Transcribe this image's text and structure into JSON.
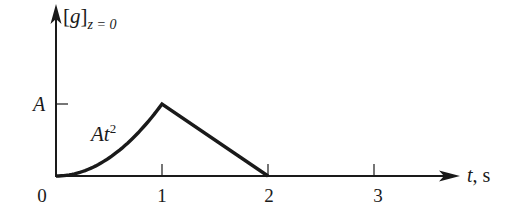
{
  "chart_data": {
    "type": "line",
    "title": "",
    "ylabel": "[g]_{z = 0}",
    "ylabel_parts": {
      "bracket_open": "[",
      "var": "g",
      "bracket_close": "]",
      "subscript": "z = 0"
    },
    "xlabel": "t, s",
    "xlabel_parts": {
      "var": "t",
      "unit": ", s"
    },
    "x_ticks": [
      0,
      1,
      2,
      3
    ],
    "x_tick_labels": [
      "0",
      "1",
      "2",
      "3"
    ],
    "y_ticks": [
      "A"
    ],
    "y_tick_labels": [
      "A"
    ],
    "xlim": [
      0,
      3.6
    ],
    "ylim": [
      0,
      1.45
    ],
    "grid": false,
    "legend": null,
    "series": [
      {
        "name": "[g]_{z=0}",
        "segments": [
          {
            "range": [
              0,
              1
            ],
            "expression": "A t^2",
            "x": [
              0,
              0.25,
              0.5,
              0.75,
              1.0
            ],
            "y": [
              0,
              0.0625,
              0.25,
              0.5625,
              1.0
            ]
          },
          {
            "range": [
              1,
              2
            ],
            "expression": "A (2 - t)",
            "x": [
              1,
              2
            ],
            "y": [
              1.0,
              0.0
            ]
          }
        ],
        "x": [
          0,
          0.25,
          0.5,
          0.75,
          1.0,
          2.0
        ],
        "y": [
          0,
          0.0625,
          0.25,
          0.5625,
          1.0,
          0.0
        ],
        "y_units": "A"
      }
    ],
    "annotations": [
      {
        "text": "At^2",
        "base": "At",
        "superscript": "2",
        "near": {
          "x": 0.6,
          "y": 0.55
        }
      }
    ]
  },
  "labels": {
    "y_axis": {
      "open": "[",
      "var": "g",
      "close": "]",
      "sub": "z = 0"
    },
    "x_axis": {
      "var": "t",
      "unit": ", s"
    },
    "curve_annotation": {
      "base": "At",
      "sup": "2"
    },
    "y_tick_A": "A",
    "x_ticks": [
      "0",
      "1",
      "2",
      "3"
    ]
  },
  "colors": {
    "ink": "#1a1a1a",
    "background": "#ffffff"
  }
}
